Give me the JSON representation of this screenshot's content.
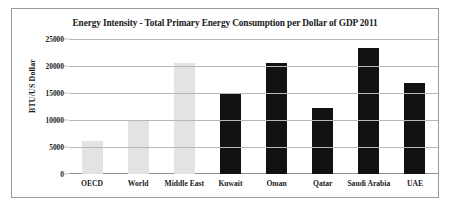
{
  "figure": {
    "border_color": "#9a9a9a",
    "background": "#ffffff"
  },
  "chart_data": {
    "type": "bar",
    "title": "Energy Intensity - Total Primary Energy Consumption per Dollar of GDP 2011",
    "xlabel": "",
    "ylabel": "BTU/US Dollar",
    "categories": [
      "OECD",
      "World",
      "Middle East",
      "Kuwait",
      "Oman",
      "Qatar",
      "Saudi Arabia",
      "UAE"
    ],
    "values": [
      6200,
      10000,
      20600,
      15000,
      20500,
      12200,
      23300,
      16900
    ],
    "bar_colors": [
      "#e3e3e3",
      "#e3e3e3",
      "#e3e3e3",
      "#111111",
      "#111111",
      "#111111",
      "#111111",
      "#111111"
    ],
    "ylim": [
      0,
      25000
    ],
    "ytick_labels": [
      "25000",
      "20000",
      "15000",
      "10000",
      "5000",
      "0"
    ],
    "ytick_values": [
      25000,
      20000,
      15000,
      10000,
      5000,
      0
    ],
    "grid": true,
    "grid_color": "#b7b7b7",
    "legend": null,
    "legend_position": "none"
  }
}
